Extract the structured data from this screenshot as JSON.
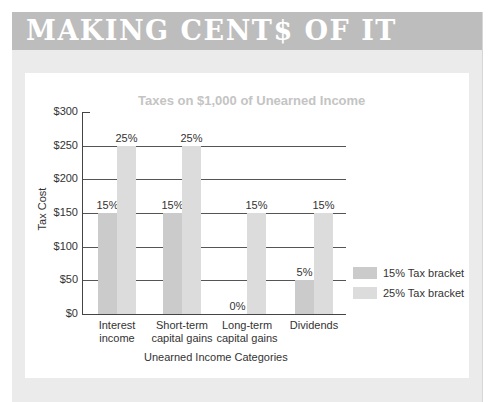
{
  "banner": {
    "title": "MAKING CENT$ OF IT"
  },
  "colors": {
    "banner_bg": "#bdbdbd",
    "frame_bg": "#ebebeb",
    "series_15": "#cbcbcb",
    "series_25": "#dcdcdc"
  },
  "chart_data": {
    "type": "bar",
    "title": "Taxes on $1,000 of Unearned Income",
    "xlabel": "Unearned Income Categories",
    "ylabel": "Tax Cost",
    "ylim": [
      0,
      300
    ],
    "yticks": [
      "$0",
      "$50",
      "$100",
      "$150",
      "$200",
      "$250",
      "$300"
    ],
    "grid": true,
    "legend_position": "right",
    "categories": [
      "Interest income",
      "Short-term capital gains",
      "Long-term capital gains",
      "Dividends"
    ],
    "category_lines": [
      [
        "Interest",
        "income"
      ],
      [
        "Short-term",
        "capital gains"
      ],
      [
        "Long-term",
        "capital gains"
      ],
      [
        "Dividends",
        ""
      ]
    ],
    "series": [
      {
        "name": "15% Tax bracket",
        "values": [
          150,
          150,
          0,
          50
        ],
        "labels": [
          "15%",
          "15%",
          "0%",
          "5%"
        ]
      },
      {
        "name": "25% Tax bracket",
        "values": [
          250,
          250,
          150,
          150
        ],
        "labels": [
          "25%",
          "25%",
          "15%",
          "15%"
        ]
      }
    ]
  }
}
